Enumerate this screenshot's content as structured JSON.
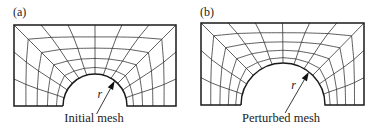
{
  "panels": [
    {
      "label": "(a)",
      "caption": "Initial mesh",
      "radius_label": "r",
      "rect": {
        "x0": 14,
        "y0": 25,
        "x1": 176,
        "y1": 106
      },
      "hole": {
        "cx": 95,
        "cy": 106,
        "r": 32
      }
    },
    {
      "label": "(b)",
      "caption": "Perturbed mesh",
      "radius_label": "r",
      "rect": {
        "x0": 14,
        "y0": 23,
        "x1": 177,
        "y1": 105
      },
      "hole": {
        "cx": 96,
        "cy": 105,
        "r": 42
      }
    }
  ],
  "mesh": {
    "spokes": 12,
    "rings": 5,
    "line_color": "#2a2a2a",
    "boundary_color": "#1a1a1a"
  }
}
